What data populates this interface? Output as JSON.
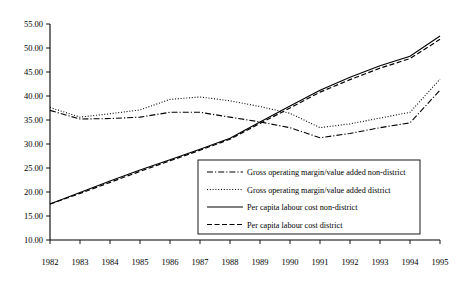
{
  "chart_data": {
    "type": "line",
    "title": "",
    "subtitle": "",
    "xlabel": "",
    "ylabel": "",
    "x": [
      1982,
      1983,
      1984,
      1985,
      1986,
      1987,
      1988,
      1989,
      1990,
      1991,
      1992,
      1993,
      1994,
      1995
    ],
    "xtick_labels": [
      "1982",
      "1983",
      "1984",
      "1985",
      "1986",
      "1987",
      "1988",
      "1989",
      "1990",
      "1991",
      "1992",
      "1993",
      "1994",
      "1995"
    ],
    "ytick_labels": [
      "10.00",
      "15.00",
      "20.00",
      "25.00",
      "30.00",
      "35.00",
      "40.00",
      "45.00",
      "50.00",
      "55.00"
    ],
    "ytick_values": [
      10,
      15,
      20,
      25,
      30,
      35,
      40,
      45,
      50,
      55
    ],
    "ylim": [
      10,
      55
    ],
    "xlim": [
      1982,
      1995
    ],
    "grid": false,
    "legend_position": "inside-lower-right",
    "series": [
      {
        "name": "Gross operating margin/value added non-district",
        "style": "dashdot",
        "values": [
          37.0,
          35.2,
          35.3,
          35.6,
          36.6,
          36.6,
          35.6,
          34.6,
          33.4,
          31.3,
          32.2,
          33.4,
          34.4,
          41.2
        ]
      },
      {
        "name": "Gross operating margin/value added district",
        "style": "dotted",
        "values": [
          37.6,
          35.6,
          36.3,
          37.1,
          39.3,
          39.8,
          39.0,
          37.8,
          36.4,
          33.4,
          34.2,
          35.4,
          36.6,
          43.5
        ]
      },
      {
        "name": "Per capita labour cost non-district",
        "style": "solid",
        "values": [
          17.5,
          19.9,
          22.3,
          24.6,
          26.7,
          28.9,
          31.2,
          34.6,
          37.9,
          41.2,
          43.9,
          46.3,
          48.3,
          52.5
        ]
      },
      {
        "name": "Per capita labour cost district",
        "style": "dashed",
        "values": [
          17.5,
          19.7,
          22.0,
          24.3,
          26.5,
          28.7,
          31.0,
          34.3,
          37.5,
          40.8,
          43.4,
          45.8,
          47.8,
          51.8
        ]
      }
    ],
    "legend_entries": [
      {
        "label": "Gross operating margin/value added non-district",
        "style": "dashdot"
      },
      {
        "label": "Gross operating margin/value added district",
        "style": "dotted"
      },
      {
        "label": "Per capita labour cost non-district",
        "style": "solid"
      },
      {
        "label": "Per capita labour cost district",
        "style": "dashed"
      }
    ]
  }
}
